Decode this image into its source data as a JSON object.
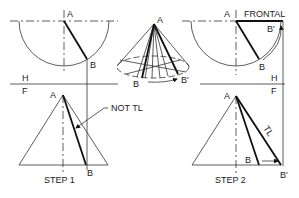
{
  "figure": {
    "step1": {
      "label_A_top": "A",
      "label_B_top": "B",
      "label_H": "H",
      "label_F": "F",
      "label_A_front": "A",
      "label_B_front": "B",
      "callout": "NOT TL",
      "caption": "STEP 1"
    },
    "pictorial": {
      "label_A": "A",
      "label_B": "B",
      "label_B_prime": "B'"
    },
    "step2": {
      "label_A_top": "A",
      "label_frontal": "FRONTAL",
      "label_B_prime_top": "B'",
      "label_B_top": "B",
      "label_H": "H",
      "label_F": "F",
      "label_A_front": "A",
      "label_TL": "TL",
      "label_B_front": "B",
      "label_B_prime_front": "B'",
      "caption": "STEP 2"
    }
  }
}
